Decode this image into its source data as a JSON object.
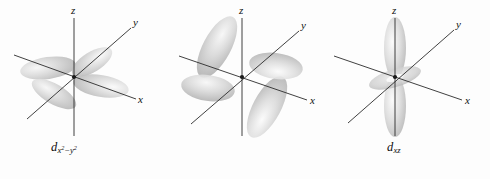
{
  "figure": {
    "background_color": "#fdfdfd",
    "width": 490,
    "height": 179,
    "axis_color": "#2b2b2b",
    "lobe_color": "#c9c9c9",
    "lobe_edge_color": "#9a9a9a",
    "text_color": "#0d0d0d"
  },
  "panels": [
    {
      "id": "d-x2-y2",
      "label_base": "d",
      "label_sub_main": "x",
      "label_sub_exp1": "2",
      "label_sub_minus": "−",
      "label_sub_var2": "y",
      "label_sub_exp2": "2",
      "label_plain": "d x2−y2",
      "axes": [
        {
          "name": "z-axis",
          "label": "z"
        },
        {
          "name": "y-axis",
          "label": "y"
        },
        {
          "name": "x-axis",
          "label": "x"
        }
      ],
      "shape": "four-lobed cloverleaf aligned along x and y axes",
      "lobe_count": 4
    },
    {
      "id": "d-xz",
      "label_base": "d",
      "label_sub_main": "xz",
      "label_plain": "d xz",
      "axes": [
        {
          "name": "z-axis",
          "label": "z"
        },
        {
          "name": "y-axis",
          "label": "y"
        },
        {
          "name": "x-axis",
          "label": "x"
        }
      ],
      "shape": "four-lobed cloverleaf rotated between x and z axes",
      "lobe_count": 4
    },
    {
      "id": "d-z2",
      "label_base": "d",
      "label_sub_main": "z",
      "label_sub_exp1": "2",
      "label_plain": "d z2",
      "axes": [
        {
          "name": "z-axis",
          "label": "z"
        },
        {
          "name": "y-axis",
          "label": "y"
        },
        {
          "name": "x-axis",
          "label": "x"
        }
      ],
      "shape": "vertical dumbbell along z with equatorial torus",
      "lobe_count": 2
    }
  ]
}
